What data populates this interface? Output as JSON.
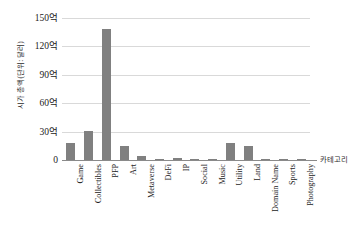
{
  "chart_data": {
    "type": "bar",
    "title": "",
    "subtitle": "",
    "xlabel": "카테고리",
    "ylabel": "시가 총액(단위: 달러)",
    "categories": [
      "Game",
      "Collectibles",
      "PFP",
      "Art",
      "Metaverse",
      "DeFi",
      "IP",
      "Social",
      "Music",
      "Utility",
      "Land",
      "Domain Name",
      "Sports",
      "Photography"
    ],
    "values": [
      17.5,
      31.0,
      138.0,
      15.0,
      4.5,
      0.6,
      2.0,
      0.9,
      0.4,
      17.5,
      15.0,
      0.9,
      0.6,
      1.0
    ],
    "value_unit": "억 달러",
    "ylim": [
      0,
      150
    ],
    "y_ticks": [
      0,
      30,
      60,
      90,
      120,
      150
    ],
    "y_tick_labels": [
      "0",
      "30억",
      "60억",
      "90억",
      "120억",
      "150억"
    ],
    "grid": true,
    "legend": false,
    "legend_position": "none",
    "bar_color": "#808080",
    "gridline_color": "#d9d9d9",
    "axis_color": "#8a8a8a",
    "background_color": "#ffffff"
  }
}
